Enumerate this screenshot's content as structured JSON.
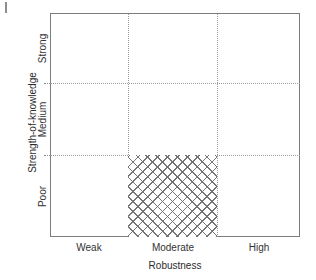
{
  "chart_data": {
    "type": "heatmap",
    "title": "",
    "xlabel": "Robustness",
    "ylabel": "Strength-of-knowledge",
    "x_categories": [
      "Weak",
      "Moderate",
      "High"
    ],
    "y_categories": [
      "Poor",
      "Medium",
      "Strong"
    ],
    "grid": true,
    "legend": "none",
    "cells": [
      {
        "x": "Weak",
        "y": "Poor",
        "highlighted": false
      },
      {
        "x": "Moderate",
        "y": "Poor",
        "highlighted": true,
        "fill": "cross-hatch"
      },
      {
        "x": "High",
        "y": "Poor",
        "highlighted": false
      },
      {
        "x": "Weak",
        "y": "Medium",
        "highlighted": false
      },
      {
        "x": "Moderate",
        "y": "Medium",
        "highlighted": false
      },
      {
        "x": "High",
        "y": "Medium",
        "highlighted": false
      },
      {
        "x": "Weak",
        "y": "Strong",
        "highlighted": false
      },
      {
        "x": "Moderate",
        "y": "Strong",
        "highlighted": false
      },
      {
        "x": "High",
        "y": "Strong",
        "highlighted": false
      }
    ],
    "highlighted_region": {
      "x": "Moderate",
      "y": "Poor",
      "pattern": "cross-hatch"
    },
    "colors": {
      "frame": "#7d7d7d",
      "gridline": "#9a9a9a",
      "hatch": "#6e6e6e",
      "background": "#ffffff",
      "text": "#2b2b2b"
    }
  },
  "axes": {
    "y": {
      "title": "Strength-of-knowledge",
      "ticks": [
        {
          "label": "Strong"
        },
        {
          "label": "Medium"
        },
        {
          "label": "Poor"
        }
      ]
    },
    "x": {
      "title": "Robustness",
      "ticks": [
        {
          "label": "Weak"
        },
        {
          "label": "Moderate"
        },
        {
          "label": "High"
        }
      ]
    }
  }
}
